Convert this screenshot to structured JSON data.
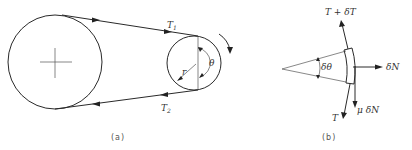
{
  "figure_a": {
    "caption": "(a)",
    "labels": {
      "tension_tight": "T",
      "tension_tight_sub": "1",
      "tension_slack": "T",
      "tension_slack_sub": "2",
      "radius": "r",
      "angle": "θ"
    }
  },
  "figure_b": {
    "caption": "(b)",
    "labels": {
      "tension_top": "T + δT",
      "tension_bottom": "T",
      "normal_force": "δN",
      "friction_force": "μ δN",
      "angle": "δθ"
    }
  },
  "colors": {
    "line": "#2a2a2a",
    "text": "#333333",
    "background": "#ffffff"
  }
}
